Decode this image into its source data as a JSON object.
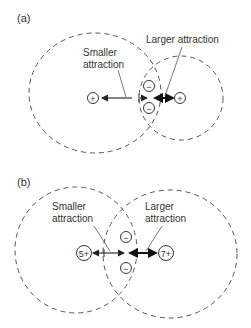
{
  "panels": [
    {
      "id": "a",
      "label": "(a)",
      "left_charge": "+",
      "right_charge": "+",
      "electrons": [
        "−",
        "−"
      ],
      "smaller_label": [
        "Smaller",
        "attraction"
      ],
      "larger_label": "Larger attraction"
    },
    {
      "id": "b",
      "label": "(b)",
      "left_charge": "5+",
      "right_charge": "7+",
      "electrons": [
        "−",
        "−"
      ],
      "smaller_label": [
        "Smaller",
        "attraction"
      ],
      "larger_label": [
        "Larger",
        "attraction"
      ]
    }
  ],
  "colors": {
    "line": "#333333",
    "dash": "#555555"
  }
}
